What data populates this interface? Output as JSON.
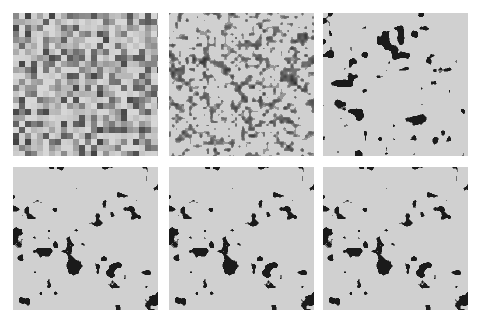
{
  "figure": {
    "layout": {
      "rows": 2,
      "cols": 3
    },
    "colors": {
      "background": "#ffffff",
      "pore_light": "#d0d0d0",
      "solid_dark": "#1a1a1a"
    },
    "panels": [
      {
        "id": "p1",
        "row": 0,
        "col": 0,
        "x": 13,
        "y": 13,
        "w": 145,
        "h": 143,
        "style": "blocky-gray",
        "block": 6,
        "seed": 11
      },
      {
        "id": "p2",
        "row": 0,
        "col": 1,
        "x": 169,
        "y": 13,
        "w": 145,
        "h": 143,
        "style": "fine-speckle",
        "block": 3,
        "seed": 23
      },
      {
        "id": "p3",
        "row": 0,
        "col": 2,
        "x": 323,
        "y": 13,
        "w": 145,
        "h": 143,
        "style": "binary-blobs",
        "seed": 37,
        "threshold": 0.3
      },
      {
        "id": "p4",
        "row": 1,
        "col": 0,
        "x": 13,
        "y": 167,
        "w": 145,
        "h": 143,
        "style": "binary-blobs",
        "seed": 51,
        "threshold": 0.31
      },
      {
        "id": "p5",
        "row": 1,
        "col": 1,
        "x": 169,
        "y": 167,
        "w": 145,
        "h": 143,
        "style": "binary-blobs",
        "seed": 51,
        "threshold": 0.31
      },
      {
        "id": "p6",
        "row": 1,
        "col": 2,
        "x": 323,
        "y": 167,
        "w": 145,
        "h": 143,
        "style": "binary-blobs",
        "seed": 51,
        "threshold": 0.31
      }
    ]
  }
}
